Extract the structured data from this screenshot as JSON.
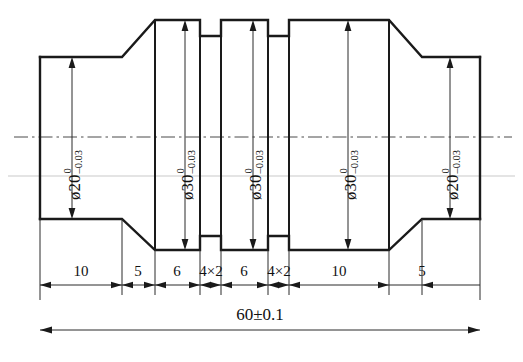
{
  "drawing": {
    "type": "engineering-drawing",
    "subject": "stepped-shaft",
    "symmetry": "horizontal-axis",
    "caption": "",
    "symbols": {
      "diameter": "ø",
      "plus_minus": "±",
      "multiply": "×"
    },
    "diameters": [
      {
        "id": "d1",
        "label": "ø20",
        "value": 20,
        "tol_upper": "0",
        "tol_lower": "–0.03",
        "section": "left-end"
      },
      {
        "id": "d2",
        "label": "ø30",
        "value": 30,
        "tol_upper": "0",
        "tol_lower": "–0.03",
        "section": "left-collar"
      },
      {
        "id": "d3",
        "label": "ø30",
        "value": 30,
        "tol_upper": "0",
        "tol_lower": "–0.03",
        "section": "middle-collar"
      },
      {
        "id": "d4",
        "label": "ø30",
        "value": 30,
        "tol_upper": "0",
        "tol_lower": "–0.03",
        "section": "right-collar"
      },
      {
        "id": "d5",
        "label": "ø20",
        "value": 20,
        "tol_upper": "0",
        "tol_lower": "–0.03",
        "section": "right-end"
      }
    ],
    "lengths": [
      {
        "id": "L1",
        "label": "10",
        "value": 10,
        "feature": "left-journal"
      },
      {
        "id": "L2",
        "label": "5",
        "value": 5,
        "feature": "left-taper"
      },
      {
        "id": "L3",
        "label": "6",
        "value": 6,
        "feature": "left-collar"
      },
      {
        "id": "L4",
        "label": "4×2",
        "value": 4,
        "feature": "left-groove"
      },
      {
        "id": "L5",
        "label": "6",
        "value": 6,
        "feature": "middle-collar"
      },
      {
        "id": "L6",
        "label": "4×2",
        "value": 4,
        "feature": "right-groove"
      },
      {
        "id": "L7",
        "label": "10",
        "value": 10,
        "feature": "right-collar"
      },
      {
        "id": "L8",
        "label": "5",
        "value": 5,
        "feature": "right-taper"
      }
    ],
    "overall": {
      "label": "60±0.1",
      "value": 60,
      "tolerance": "±0.1"
    },
    "colors": {
      "outline": "#1a1a1a",
      "centerline": "#4a4a4a",
      "dimension": "#2b2b2b",
      "paper": "#ffffff",
      "faint_rule": "#c9c9c9"
    }
  }
}
